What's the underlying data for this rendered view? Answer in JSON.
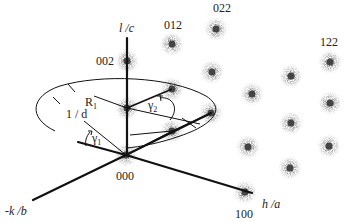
{
  "diagram": {
    "axes": {
      "vertical": "l /c",
      "horizontal": "h /a",
      "depth": "-k /b"
    },
    "annotations": {
      "radius": "R",
      "radius_sub": "1",
      "inv_d": "1 / d",
      "gamma1": "γ",
      "gamma1_sub": "1",
      "gamma2": "γ",
      "gamma2_sub": "2"
    },
    "spot_labels": [
      {
        "id": "origin",
        "text": "000"
      },
      {
        "id": "h100",
        "text": "100"
      },
      {
        "id": "l002",
        "text": "002"
      },
      {
        "id": "k012",
        "text": "012"
      },
      {
        "id": "k022",
        "text": "022"
      },
      {
        "id": "h122",
        "text": "122"
      }
    ],
    "colors": {
      "ink": "#111111",
      "spot_core": "#444444",
      "spot_halo": "#6a6a6a"
    }
  }
}
